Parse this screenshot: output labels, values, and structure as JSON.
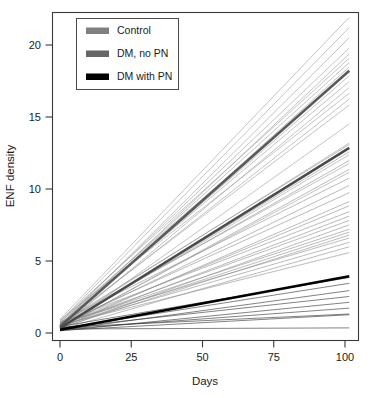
{
  "chart_data": {
    "type": "line",
    "title": "",
    "xlabel": "Days",
    "ylabel": "ENF density",
    "xlim": [
      -4,
      106
    ],
    "ylim": [
      -0.9,
      22.4
    ],
    "xticks": [
      0,
      25,
      50,
      75,
      100
    ],
    "yticks": [
      0,
      5,
      10,
      15,
      20
    ],
    "xtick_labels": [
      "0",
      "25",
      "50",
      "75",
      "100"
    ],
    "ytick_labels": [
      "0",
      "5",
      "10",
      "15",
      "20"
    ],
    "grid": false,
    "legend_position": "top-left",
    "groups": [
      {
        "name": "Control",
        "color": "#808080",
        "mean_color": "#5a5a5a",
        "line_color": "#9a9a9a",
        "mean": {
          "intercept": 0.45,
          "slope": 0.1755,
          "value_at_100": 18.0
        },
        "subjects": [
          {
            "intercept": 0.95,
            "value_at_100": 21.6
          },
          {
            "intercept": 0.8,
            "value_at_100": 20.9
          },
          {
            "intercept": 0.55,
            "value_at_100": 20.2
          },
          {
            "intercept": 0.7,
            "value_at_100": 19.5
          },
          {
            "intercept": 0.4,
            "value_at_100": 19.1
          },
          {
            "intercept": 0.85,
            "value_at_100": 18.8
          },
          {
            "intercept": 0.6,
            "value_at_100": 18.5
          },
          {
            "intercept": 0.35,
            "value_at_100": 18.2
          },
          {
            "intercept": 0.75,
            "value_at_100": 17.9
          },
          {
            "intercept": 0.5,
            "value_at_100": 17.6
          },
          {
            "intercept": 0.65,
            "value_at_100": 17.2
          },
          {
            "intercept": 0.3,
            "value_at_100": 16.8
          },
          {
            "intercept": 0.9,
            "value_at_100": 16.4
          },
          {
            "intercept": 0.45,
            "value_at_100": 16.0
          },
          {
            "intercept": 0.6,
            "value_at_100": 15.6
          },
          {
            "intercept": 0.25,
            "value_at_100": 14.3
          },
          {
            "intercept": 0.55,
            "value_at_100": 13.0
          },
          {
            "intercept": 0.4,
            "value_at_100": 12.2
          },
          {
            "intercept": 0.7,
            "value_at_100": 11.6
          },
          {
            "intercept": 0.35,
            "value_at_100": 11.0
          }
        ]
      },
      {
        "name": "DM, no PN",
        "color": "#666666",
        "mean_color": "#4a4a4a",
        "line_color": "#8a8a8a",
        "mean": {
          "intercept": 0.35,
          "slope": 0.1235,
          "value_at_100": 12.7
        },
        "subjects": [
          {
            "intercept": 0.65,
            "value_at_100": 12.9
          },
          {
            "intercept": 0.4,
            "value_at_100": 12.4
          },
          {
            "intercept": 0.55,
            "value_at_100": 11.8
          },
          {
            "intercept": 0.3,
            "value_at_100": 11.2
          },
          {
            "intercept": 0.75,
            "value_at_100": 10.6
          },
          {
            "intercept": 0.45,
            "value_at_100": 10.1
          },
          {
            "intercept": 0.6,
            "value_at_100": 9.6
          },
          {
            "intercept": 0.35,
            "value_at_100": 9.0
          },
          {
            "intercept": 0.5,
            "value_at_100": 8.7
          },
          {
            "intercept": 0.7,
            "value_at_100": 8.3
          },
          {
            "intercept": 0.4,
            "value_at_100": 8.0
          },
          {
            "intercept": 0.55,
            "value_at_100": 7.7
          },
          {
            "intercept": 0.3,
            "value_at_100": 7.4
          },
          {
            "intercept": 0.6,
            "value_at_100": 7.1
          },
          {
            "intercept": 0.45,
            "value_at_100": 6.9
          },
          {
            "intercept": 0.35,
            "value_at_100": 6.7
          },
          {
            "intercept": 0.65,
            "value_at_100": 6.5
          },
          {
            "intercept": 0.5,
            "value_at_100": 6.2
          },
          {
            "intercept": 0.25,
            "value_at_100": 5.9
          },
          {
            "intercept": 0.55,
            "value_at_100": 5.5
          }
        ]
      },
      {
        "name": "DM with PN",
        "color": "#000000",
        "mean_color": "#000000",
        "line_color": "#2a2a2a",
        "mean": {
          "intercept": 0.22,
          "slope": 0.0368,
          "value_at_100": 3.9
        },
        "subjects": [
          {
            "intercept": 0.45,
            "value_at_100": 3.8
          },
          {
            "intercept": 0.3,
            "value_at_100": 3.4
          },
          {
            "intercept": 0.2,
            "value_at_100": 2.9
          },
          {
            "intercept": 0.35,
            "value_at_100": 2.5
          },
          {
            "intercept": 0.15,
            "value_at_100": 2.1
          },
          {
            "intercept": 0.25,
            "value_at_100": 1.7
          },
          {
            "intercept": 0.4,
            "value_at_100": 1.3
          },
          {
            "intercept": 0.18,
            "value_at_100": 1.25
          },
          {
            "intercept": 0.28,
            "value_at_100": 0.35
          }
        ]
      }
    ]
  },
  "legend": {
    "entries": [
      {
        "label": "Control",
        "swatch": "#808080"
      },
      {
        "label": "DM, no PN",
        "swatch": "#666666"
      },
      {
        "label": "DM with PN",
        "swatch": "#000000"
      }
    ]
  },
  "axes": {
    "x_title": "Days",
    "y_title": "ENF density"
  }
}
